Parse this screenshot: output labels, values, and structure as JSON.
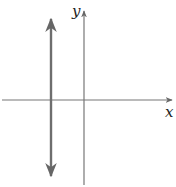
{
  "diagram": {
    "type": "coordinate-plane-with-vertical-line",
    "x_axis_label": "x",
    "y_axis_label": "y",
    "line": {
      "orientation": "vertical",
      "position": "left of y-axis",
      "arrows": "both ends"
    },
    "colors": {
      "axis": "#777777",
      "line": "#6e6e6e",
      "label": "#222222"
    }
  }
}
